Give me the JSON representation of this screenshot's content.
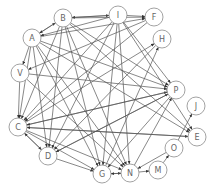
{
  "diagram": {
    "type": "directed-graph",
    "colors": {
      "edge": "#555555",
      "node_stroke": "#8a8a8a",
      "label": "#666666",
      "background": "#ffffff"
    },
    "nodes": [
      {
        "id": "B",
        "label": "B"
      },
      {
        "id": "I",
        "label": "I"
      },
      {
        "id": "F",
        "label": "F"
      },
      {
        "id": "A",
        "label": "A"
      },
      {
        "id": "H",
        "label": "H"
      },
      {
        "id": "V",
        "label": "V"
      },
      {
        "id": "P",
        "label": "P"
      },
      {
        "id": "J",
        "label": "J"
      },
      {
        "id": "C",
        "label": "C"
      },
      {
        "id": "E",
        "label": "E"
      },
      {
        "id": "O",
        "label": "O"
      },
      {
        "id": "D",
        "label": "D"
      },
      {
        "id": "M",
        "label": "M"
      },
      {
        "id": "G",
        "label": "G"
      },
      {
        "id": "N",
        "label": "N"
      }
    ],
    "edges": [
      [
        "B",
        "I"
      ],
      [
        "I",
        "B"
      ],
      [
        "A",
        "B"
      ],
      [
        "B",
        "A"
      ],
      [
        "I",
        "F"
      ],
      [
        "I",
        "A"
      ],
      [
        "B",
        "P"
      ],
      [
        "I",
        "P"
      ],
      [
        "A",
        "P"
      ],
      [
        "V",
        "P"
      ],
      [
        "A",
        "F"
      ],
      [
        "B",
        "F"
      ],
      [
        "C",
        "P"
      ],
      [
        "D",
        "P"
      ],
      [
        "N",
        "P"
      ],
      [
        "G",
        "H"
      ],
      [
        "C",
        "H"
      ],
      [
        "B",
        "E"
      ],
      [
        "I",
        "E"
      ],
      [
        "A",
        "E"
      ],
      [
        "C",
        "E"
      ],
      [
        "O",
        "J"
      ],
      [
        "M",
        "O"
      ],
      [
        "N",
        "M"
      ],
      [
        "O",
        "N"
      ],
      [
        "C",
        "D"
      ],
      [
        "D",
        "C"
      ],
      [
        "D",
        "G"
      ],
      [
        "C",
        "G"
      ],
      [
        "G",
        "N"
      ],
      [
        "N",
        "G"
      ],
      [
        "A",
        "D"
      ],
      [
        "B",
        "D"
      ],
      [
        "I",
        "D"
      ],
      [
        "A",
        "C"
      ],
      [
        "B",
        "C"
      ],
      [
        "V",
        "C"
      ],
      [
        "A",
        "V"
      ],
      [
        "B",
        "G"
      ],
      [
        "I",
        "N"
      ],
      [
        "P",
        "D"
      ],
      [
        "F",
        "C"
      ],
      [
        "H",
        "D"
      ],
      [
        "P",
        "C"
      ],
      [
        "I",
        "G"
      ],
      [
        "A",
        "N"
      ],
      [
        "V",
        "N"
      ],
      [
        "B",
        "N"
      ],
      [
        "E",
        "C"
      ],
      [
        "F",
        "V"
      ],
      [
        "P",
        "G"
      ],
      [
        "C",
        "N"
      ],
      [
        "A",
        "G"
      ],
      [
        "I",
        "C"
      ]
    ]
  }
}
